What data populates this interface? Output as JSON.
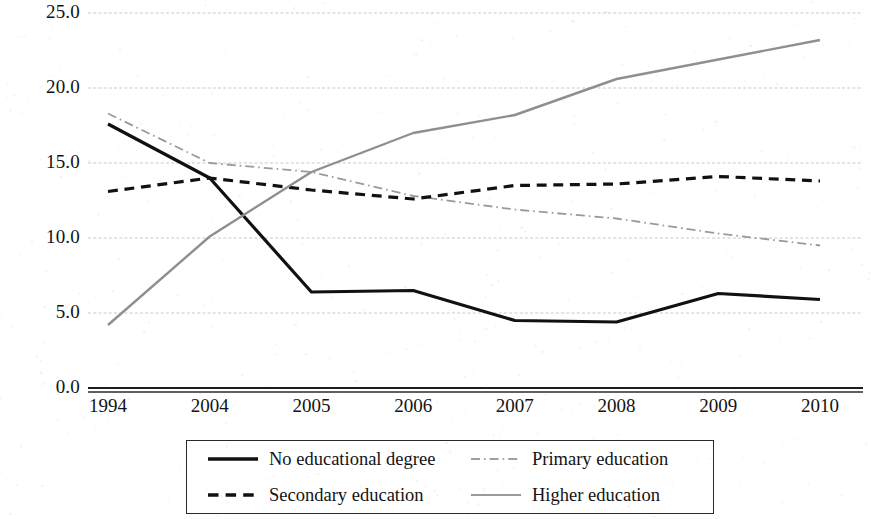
{
  "chart_data": {
    "type": "line",
    "title": "",
    "subtitle": "",
    "xlabel": "",
    "ylabel": "",
    "categories": [
      "1994",
      "2004",
      "2005",
      "2006",
      "2007",
      "2008",
      "2009",
      "2010"
    ],
    "ylim": [
      0.0,
      25.0
    ],
    "y_ticks": [
      0.0,
      5.0,
      10.0,
      15.0,
      20.0,
      25.0
    ],
    "y_tick_labels": [
      "0.0",
      "5.0",
      "10.0",
      "15.0",
      "20.0",
      "25.0"
    ],
    "grid": true,
    "grid_axis": "y",
    "legend_position": "bottom",
    "series": [
      {
        "name": "No educational degree",
        "style": "solid",
        "color": "#111111",
        "width": 3.2,
        "values": [
          17.6,
          14.0,
          6.4,
          6.5,
          4.5,
          4.4,
          6.3,
          5.9
        ]
      },
      {
        "name": "Primary education",
        "style": "dashdot",
        "color": "#9a9a9a",
        "width": 1.8,
        "values": [
          18.3,
          15.0,
          14.4,
          12.8,
          11.9,
          11.3,
          10.3,
          9.5
        ]
      },
      {
        "name": "Secondary education",
        "style": "dashed",
        "color": "#111111",
        "width": 3.2,
        "values": [
          13.1,
          14.0,
          13.2,
          12.6,
          13.5,
          13.6,
          14.1,
          13.8
        ]
      },
      {
        "name": "Higher education",
        "style": "solid",
        "color": "#8f8f8f",
        "width": 2.4,
        "values": [
          4.2,
          10.1,
          14.4,
          17.0,
          18.2,
          20.6,
          21.9,
          23.2
        ]
      }
    ]
  },
  "legend": {
    "items": [
      {
        "label": "No educational degree",
        "style": "solid",
        "color": "#111111",
        "width": 3.4
      },
      {
        "label": "Primary education",
        "style": "dashdot",
        "color": "#a0a0a0",
        "width": 1.8
      },
      {
        "label": "Secondary education",
        "style": "dashed",
        "color": "#111111",
        "width": 3.4
      },
      {
        "label": "Higher education",
        "style": "solid",
        "color": "#9a9a9a",
        "width": 1.8
      }
    ]
  }
}
